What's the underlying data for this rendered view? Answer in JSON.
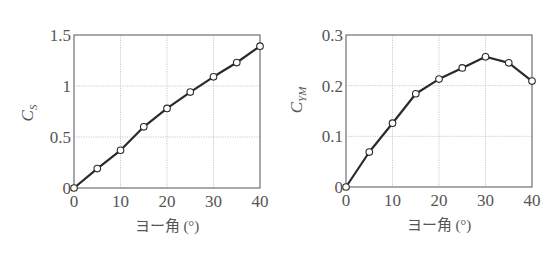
{
  "chart_data": [
    {
      "type": "line",
      "title": "",
      "xlabel": "ヨー角 (°)",
      "ylabel": "C_S",
      "ylabel_main": "C",
      "ylabel_sub": "S",
      "x": [
        0,
        5,
        10,
        15,
        20,
        25,
        30,
        35,
        40
      ],
      "series": [
        {
          "name": "C_S",
          "values": [
            0,
            0.19,
            0.37,
            0.6,
            0.78,
            0.94,
            1.09,
            1.23,
            1.39
          ]
        }
      ],
      "xlim": [
        0,
        40
      ],
      "ylim": [
        0,
        1.5
      ],
      "xticks": [
        0,
        10,
        20,
        30,
        40
      ],
      "yticks": [
        0,
        0.5,
        1,
        1.5
      ],
      "xtick_labels": [
        "0",
        "10",
        "20",
        "30",
        "40"
      ],
      "ytick_labels": [
        "0",
        "0.5",
        "1",
        "1.5"
      ],
      "grid": true,
      "marker": "open-circle",
      "legend": null
    },
    {
      "type": "line",
      "title": "",
      "xlabel": "ヨー角 (°)",
      "ylabel": "C_YM",
      "ylabel_main": "C",
      "ylabel_sub": "YM",
      "x": [
        0,
        5,
        10,
        15,
        20,
        25,
        30,
        35,
        40
      ],
      "series": [
        {
          "name": "C_YM",
          "values": [
            0,
            0.069,
            0.126,
            0.184,
            0.213,
            0.235,
            0.257,
            0.245,
            0.209
          ]
        }
      ],
      "xlim": [
        0,
        40
      ],
      "ylim": [
        0,
        0.3
      ],
      "xticks": [
        0,
        10,
        20,
        30,
        40
      ],
      "yticks": [
        0,
        0.1,
        0.2,
        0.3
      ],
      "xtick_labels": [
        "0",
        "10",
        "20",
        "30",
        "40"
      ],
      "ytick_labels": [
        "0",
        "0.1",
        "0.2",
        "0.3"
      ],
      "grid": true,
      "marker": "open-circle",
      "legend": null
    }
  ],
  "layout": {
    "plots": [
      {
        "left": 74,
        "right": 260,
        "top": 35,
        "bottom": 188
      },
      {
        "left": 346,
        "right": 532,
        "top": 35,
        "bottom": 187
      }
    ]
  },
  "colors": {
    "line": "#2a2a2a",
    "frame": "#707070",
    "grid": "#bdbdbd",
    "text": "#555555",
    "marker_fill": "#ffffff"
  }
}
